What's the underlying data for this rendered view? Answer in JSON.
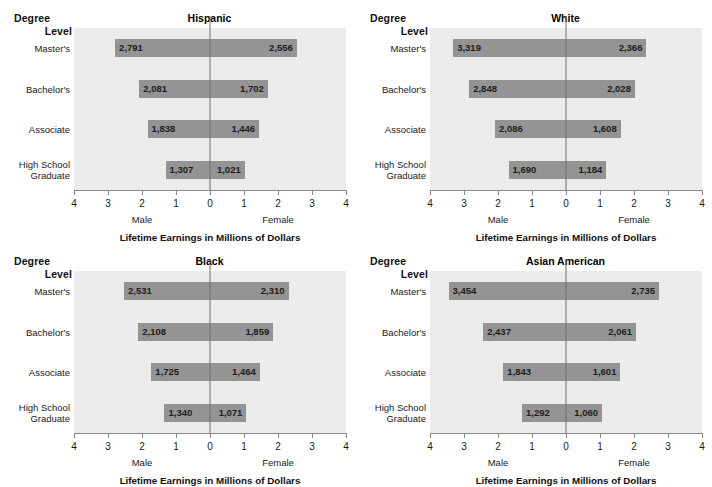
{
  "figure": {
    "axis_header_line1": "Degree",
    "axis_header_line2": "Level",
    "x_axis_title": "Lifetime Earnings in Millions of Dollars",
    "male_label": "Male",
    "female_label": "Female",
    "row_labels": [
      "Master's",
      "Bachelor's",
      "Associate",
      "High School\nGraduate"
    ],
    "tick_labels": [
      "4",
      "3",
      "2",
      "1",
      "0",
      "1",
      "2",
      "3",
      "4"
    ],
    "colors": {
      "bar": "#949494",
      "plot_background": "#ececec",
      "zero_line": "#6f6f6f",
      "axis_line": "#8a8a8a",
      "text": "#1a1a1a"
    }
  },
  "chart_data": [
    {
      "type": "bar",
      "title": "Hispanic",
      "xlabel": "Lifetime Earnings in Millions of Dollars",
      "ylabel": "Degree Level",
      "xlim": [
        -4,
        4
      ],
      "xticks": [
        -4,
        -3,
        -2,
        -1,
        0,
        1,
        2,
        3,
        4
      ],
      "xtick_labels": [
        "4",
        "3",
        "2",
        "1",
        "0",
        "1",
        "2",
        "3",
        "4"
      ],
      "grid": false,
      "legend": "none",
      "categories": [
        "Master's",
        "Bachelor's",
        "Associate",
        "High School Graduate"
      ],
      "series": [
        {
          "name": "Male",
          "direction": "left",
          "values": [
            2791,
            2081,
            1838,
            1307
          ],
          "labels": [
            "2,791",
            "2,081",
            "1,838",
            "1,307"
          ]
        },
        {
          "name": "Female",
          "direction": "right",
          "values": [
            2556,
            1702,
            1446,
            1021
          ],
          "labels": [
            "2,556",
            "1,702",
            "1,446",
            "1,021"
          ]
        }
      ]
    },
    {
      "type": "bar",
      "title": "White",
      "xlabel": "Lifetime Earnings in Millions of Dollars",
      "ylabel": "Degree Level",
      "xlim": [
        -4,
        4
      ],
      "xticks": [
        -4,
        -3,
        -2,
        -1,
        0,
        1,
        2,
        3,
        4
      ],
      "xtick_labels": [
        "4",
        "3",
        "2",
        "1",
        "0",
        "1",
        "2",
        "3",
        "4"
      ],
      "grid": false,
      "legend": "none",
      "categories": [
        "Master's",
        "Bachelor's",
        "Associate",
        "High School Graduate"
      ],
      "series": [
        {
          "name": "Male",
          "direction": "left",
          "values": [
            3319,
            2848,
            2086,
            1690
          ],
          "labels": [
            "3,319",
            "2,848",
            "2,086",
            "1,690"
          ]
        },
        {
          "name": "Female",
          "direction": "right",
          "values": [
            2366,
            2028,
            1608,
            1184
          ],
          "labels": [
            "2,366",
            "2,028",
            "1,608",
            "1,184"
          ]
        }
      ]
    },
    {
      "type": "bar",
      "title": "Black",
      "xlabel": "Lifetime Earnings in Millions of Dollars",
      "ylabel": "Degree Level",
      "xlim": [
        -4,
        4
      ],
      "xticks": [
        -4,
        -3,
        -2,
        -1,
        0,
        1,
        2,
        3,
        4
      ],
      "xtick_labels": [
        "4",
        "3",
        "2",
        "1",
        "0",
        "1",
        "2",
        "3",
        "4"
      ],
      "grid": false,
      "legend": "none",
      "categories": [
        "Master's",
        "Bachelor's",
        "Associate",
        "High School Graduate"
      ],
      "series": [
        {
          "name": "Male",
          "direction": "left",
          "values": [
            2531,
            2108,
            1725,
            1340
          ],
          "labels": [
            "2,531",
            "2,108",
            "1,725",
            "1,340"
          ]
        },
        {
          "name": "Female",
          "direction": "right",
          "values": [
            2310,
            1859,
            1464,
            1071
          ],
          "labels": [
            "2,310",
            "1,859",
            "1,464",
            "1,071"
          ]
        }
      ]
    },
    {
      "type": "bar",
      "title": "Asian American",
      "xlabel": "Lifetime Earnings in Millions of Dollars",
      "ylabel": "Degree Level",
      "xlim": [
        -4,
        4
      ],
      "xticks": [
        -4,
        -3,
        -2,
        -1,
        0,
        1,
        2,
        3,
        4
      ],
      "xtick_labels": [
        "4",
        "3",
        "2",
        "1",
        "0",
        "1",
        "2",
        "3",
        "4"
      ],
      "grid": false,
      "legend": "none",
      "categories": [
        "Master's",
        "Bachelor's",
        "Associate",
        "High School Graduate"
      ],
      "series": [
        {
          "name": "Male",
          "direction": "left",
          "values": [
            3454,
            2437,
            1843,
            1292
          ],
          "labels": [
            "3,454",
            "2,437",
            "1,843",
            "1,292"
          ]
        },
        {
          "name": "Female",
          "direction": "right",
          "values": [
            2735,
            2061,
            1601,
            1060
          ],
          "labels": [
            "2,735",
            "2,061",
            "1,601",
            "1,060"
          ]
        }
      ]
    }
  ]
}
